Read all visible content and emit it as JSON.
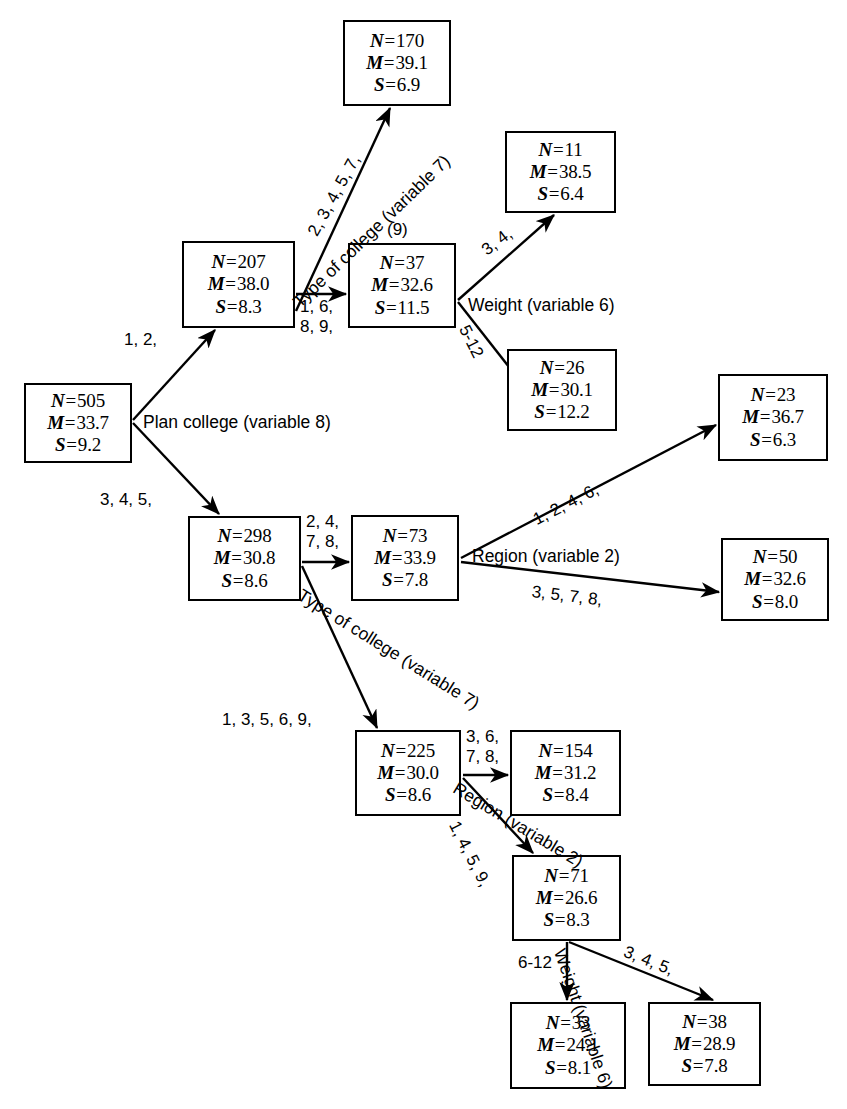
{
  "diagram": {
    "stat_keys": {
      "n": "N",
      "m": "M",
      "s": "S"
    },
    "nodes": [
      {
        "id": "root",
        "n": "505",
        "m": "33.7",
        "s": "9.2",
        "x": 24,
        "y": 383,
        "w": 108,
        "h": 80
      },
      {
        "id": "n207",
        "n": "207",
        "m": "38.0",
        "s": "8.3",
        "x": 182,
        "y": 241,
        "w": 113,
        "h": 87
      },
      {
        "id": "n170",
        "n": "170",
        "m": "39.1",
        "s": "6.9",
        "x": 343,
        "y": 20,
        "w": 108,
        "h": 86
      },
      {
        "id": "n37",
        "n": "37",
        "m": "32.6",
        "s": "11.5",
        "x": 348,
        "y": 243,
        "w": 108,
        "h": 85
      },
      {
        "id": "n11",
        "n": "11",
        "m": "38.5",
        "s": "6.4",
        "x": 505,
        "y": 131,
        "w": 111,
        "h": 82
      },
      {
        "id": "n26",
        "n": "26",
        "m": "30.1",
        "s": "12.2",
        "x": 507,
        "y": 349,
        "w": 110,
        "h": 82
      },
      {
        "id": "n298",
        "n": "298",
        "m": "30.8",
        "s": "8.6",
        "x": 188,
        "y": 516,
        "w": 113,
        "h": 85
      },
      {
        "id": "n73",
        "n": "73",
        "m": "33.9",
        "s": "7.8",
        "x": 351,
        "y": 515,
        "w": 108,
        "h": 86
      },
      {
        "id": "n23",
        "n": "23",
        "m": "36.7",
        "s": "6.3",
        "x": 718,
        "y": 374,
        "w": 110,
        "h": 87
      },
      {
        "id": "n50",
        "n": "50",
        "m": "32.6",
        "s": "8.0",
        "x": 721,
        "y": 538,
        "w": 108,
        "h": 83
      },
      {
        "id": "n225",
        "n": "225",
        "m": "30.0",
        "s": "8.6",
        "x": 355,
        "y": 730,
        "w": 106,
        "h": 86
      },
      {
        "id": "n154",
        "n": "154",
        "m": "31.2",
        "s": "8.4",
        "x": 510,
        "y": 730,
        "w": 111,
        "h": 86
      },
      {
        "id": "n71",
        "n": "71",
        "m": "26.6",
        "s": "8.3",
        "x": 512,
        "y": 855,
        "w": 109,
        "h": 86
      },
      {
        "id": "n33",
        "n": "33",
        "m": "24.1",
        "s": "8.1",
        "x": 510,
        "y": 1002,
        "w": 116,
        "h": 87
      },
      {
        "id": "n38",
        "n": "38",
        "m": "28.9",
        "s": "7.8",
        "x": 648,
        "y": 1002,
        "w": 113,
        "h": 84
      }
    ],
    "edges": [
      {
        "id": "root-to-207",
        "x1": 133,
        "y1": 420,
        "x2": 215,
        "y2": 330
      },
      {
        "id": "root-to-298",
        "x1": 133,
        "y1": 423,
        "x2": 219,
        "y2": 514
      },
      {
        "id": "n207-to-170",
        "x1": 296,
        "y1": 311,
        "x2": 390,
        "y2": 108
      },
      {
        "id": "n207-to-37",
        "x1": 296,
        "y1": 294,
        "x2": 346,
        "y2": 294
      },
      {
        "id": "n37-to-11",
        "x1": 458,
        "y1": 300,
        "x2": 554,
        "y2": 215
      },
      {
        "id": "n37-to-26",
        "x1": 458,
        "y1": 302,
        "x2": 527,
        "y2": 390
      },
      {
        "id": "n298-to-73",
        "x1": 302,
        "y1": 562,
        "x2": 349,
        "y2": 562
      },
      {
        "id": "n298-to-225",
        "x1": 302,
        "y1": 566,
        "x2": 377,
        "y2": 728
      },
      {
        "id": "n73-to-23",
        "x1": 461,
        "y1": 558,
        "x2": 716,
        "y2": 425
      },
      {
        "id": "n73-to-50",
        "x1": 461,
        "y1": 562,
        "x2": 719,
        "y2": 592
      },
      {
        "id": "n225-to-154",
        "x1": 463,
        "y1": 775,
        "x2": 508,
        "y2": 775
      },
      {
        "id": "n225-to-71",
        "x1": 463,
        "y1": 778,
        "x2": 533,
        "y2": 853
      },
      {
        "id": "n71-to-33",
        "x1": 567,
        "y1": 942,
        "x2": 567,
        "y2": 1000
      },
      {
        "id": "n71-to-38",
        "x1": 569,
        "y1": 942,
        "x2": 713,
        "y2": 1000
      }
    ],
    "edge_labels": [
      {
        "id": "root-207-label",
        "text": "1, 2,",
        "x": 124,
        "y": 330,
        "rot": 0
      },
      {
        "id": "root-298-label",
        "text": "3, 4, 5,",
        "x": 100,
        "y": 490,
        "rot": 0
      },
      {
        "id": "n207-170-label",
        "text": "2, 3, 4, 5, 7,",
        "x": 304,
        "y": 230,
        "rot": -61
      },
      {
        "id": "n207-37-label",
        "text": "1, 6,\n8, 9,",
        "x": 300,
        "y": 297,
        "rot": 0
      },
      {
        "id": "n37-11-label",
        "text": "3, 4,",
        "x": 478,
        "y": 244,
        "rot": -37
      },
      {
        "id": "n37-26-label",
        "text": "5-12",
        "x": 472,
        "y": 322,
        "rot": 63
      },
      {
        "id": "n298-73-label",
        "text": "2, 4,\n7, 8,",
        "x": 306,
        "y": 512,
        "rot": 0
      },
      {
        "id": "n73-23-label",
        "text": "1, 2, 4, 6,",
        "x": 530,
        "y": 512,
        "rot": -27
      },
      {
        "id": "n73-50-label",
        "text": "3, 5, 7, 8,",
        "x": 533,
        "y": 582,
        "rot": 7
      },
      {
        "id": "n298-225-label",
        "text": "1, 3, 5, 6, 9,",
        "x": 222,
        "y": 710,
        "rot": 0
      },
      {
        "id": "n225-154-label",
        "text": "3, 6,\n7, 8,",
        "x": 466,
        "y": 727,
        "rot": 0
      },
      {
        "id": "n225-71-label",
        "text": "1, 4, 5, 9,",
        "x": 462,
        "y": 818,
        "rot": 63
      },
      {
        "id": "n71-33-label",
        "text": "6-12",
        "x": 518,
        "y": 953,
        "rot": 0
      },
      {
        "id": "n71-38-label",
        "text": "3, 4, 5,",
        "x": 628,
        "y": 942,
        "rot": 22
      }
    ],
    "split_labels": [
      {
        "id": "split-plan-college",
        "text": "Plan college (variable 8)",
        "x": 143,
        "y": 412,
        "rot": 0
      },
      {
        "id": "split-type-college-upper",
        "text": "Type of college (variable 7)",
        "x": 289,
        "y": 297,
        "rot": -44
      },
      {
        "id": "split-weight-upper",
        "text": "Weight (variable 6)",
        "x": 468,
        "y": 295,
        "rot": 0
      },
      {
        "id": "split-region-upper",
        "text": "Region (variable 2)",
        "x": 472,
        "y": 546,
        "rot": 0
      },
      {
        "id": "split-type-college-lower",
        "text": "Type of college (variable 7)",
        "x": 305,
        "y": 585,
        "rot": 32
      },
      {
        "id": "split-region-lower",
        "text": "Region (variable 2)",
        "x": 460,
        "y": 778,
        "rot": 31
      },
      {
        "id": "split-weight-lower",
        "text": "Weight (variable 6)",
        "x": 569,
        "y": 946,
        "rot": 71
      }
    ],
    "annotations": [
      {
        "id": "annotation-9",
        "text": "(9)",
        "x": 387,
        "y": 220
      }
    ]
  }
}
